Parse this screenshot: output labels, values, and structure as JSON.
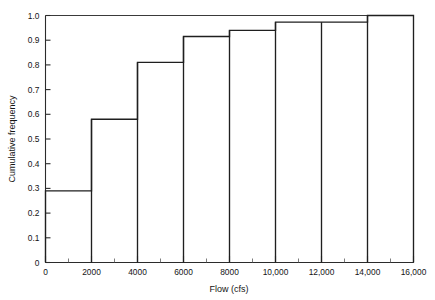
{
  "chart_data": {
    "type": "bar",
    "title": "",
    "subtitle": "",
    "xlabel": "Flow (cfs)",
    "ylabel": "Cumulative frequency",
    "xlim": [
      0,
      16000
    ],
    "ylim": [
      0,
      1.0
    ],
    "grid": false,
    "legend": null,
    "bin_width": 2000,
    "categories": [
      "0-2000",
      "2000-4000",
      "4000-6000",
      "6000-8000",
      "8000-10,000",
      "10,000-12,000",
      "12,000-14,000",
      "14,000-16,000"
    ],
    "bin_edges": [
      0,
      2000,
      4000,
      6000,
      8000,
      10000,
      12000,
      14000,
      16000
    ],
    "values": [
      0.29,
      0.58,
      0.81,
      0.915,
      0.94,
      0.973,
      0.973,
      1.0
    ],
    "x_ticks": [
      0,
      2000,
      4000,
      6000,
      8000,
      10000,
      12000,
      14000,
      16000
    ],
    "x_tick_labels": [
      "0",
      "2000",
      "4000",
      "6000",
      "8000",
      "10,000",
      "12,000",
      "14,000",
      "16,000"
    ],
    "x_minor_ticks": [
      1000,
      3000,
      5000,
      7000,
      9000,
      11000,
      13000,
      15000
    ],
    "y_ticks": [
      0,
      0.1,
      0.2,
      0.3,
      0.4,
      0.5,
      0.6,
      0.7,
      0.8,
      0.9,
      1.0
    ],
    "y_tick_labels": [
      "0",
      "0.1",
      "0.2",
      "0.3",
      "0.4",
      "0.5",
      "0.6",
      "0.7",
      "0.8",
      "0.9",
      "1.0"
    ],
    "colors": {
      "line": "#1f1f1f",
      "axis": "#2b2b2b",
      "background": "#ffffff",
      "text": "#141414"
    }
  },
  "axes": {
    "x_title": "Flow (cfs)",
    "y_title": "Cumulative frequency"
  }
}
